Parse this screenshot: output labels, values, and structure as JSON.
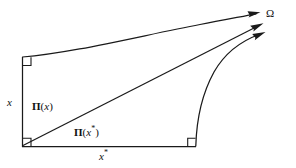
{
  "figure": {
    "background_color": "#ffffff",
    "stroke_color": "#1a1a1a"
  },
  "labels": {
    "omega": "Ω",
    "vertical_side": "x",
    "diagonal": {
      "pi": "Π",
      "open": "(",
      "arg": "x",
      "close": ")"
    },
    "horizontal_upper": {
      "pi": "Π",
      "open": "(",
      "arg": "x",
      "star": "*",
      "close": ")"
    },
    "horizontal_lower": {
      "arg": "x",
      "star": "*"
    }
  },
  "geometry": {
    "vertical_line": {
      "x": 22.5,
      "y_top": 57,
      "y_bottom": 146.5
    },
    "bottom_line": {
      "y": 146.5,
      "x_left": 22.5,
      "x_right": 196
    },
    "top_curve": {
      "start": [
        22.5,
        57
      ],
      "end": [
        256,
        14
      ],
      "arrow_tip": [
        259,
        12.5
      ]
    },
    "diagonal_line": {
      "start": [
        23,
        145.5
      ],
      "end": [
        259,
        26
      ],
      "arrow_tip": [
        263,
        24
      ]
    },
    "right_curve": {
      "start": [
        195.5,
        146
      ],
      "end": [
        261,
        35
      ],
      "arrow_tip": [
        265,
        32
      ]
    },
    "angle_markers": [
      {
        "name": "top-left",
        "x": 22.5,
        "y": 57,
        "size": 8,
        "orientation": "down-right"
      },
      {
        "name": "bottom-left",
        "x": 22.5,
        "y": 146.5,
        "size": 8,
        "orientation": "up-right"
      },
      {
        "name": "bottom-right",
        "x": 196,
        "y": 146.5,
        "size": 8,
        "orientation": "up-left"
      }
    ]
  },
  "label_positions": {
    "omega": {
      "left": 266,
      "top": 8
    },
    "vertical_side": {
      "left": 7,
      "top": 97
    },
    "diagonal": {
      "left": 32,
      "top": 101
    },
    "horizontal_upper": {
      "left": 74,
      "top": 125
    },
    "horizontal_lower": {
      "left": 99,
      "top": 149
    }
  }
}
